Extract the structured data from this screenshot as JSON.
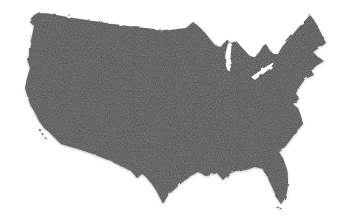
{
  "map": {
    "title": "United States map",
    "region": "Continental United States (lower 48 states)",
    "style": "dark grainy silhouette with dashed state boundaries and Great Lakes cutouts",
    "colors": {
      "background": "#ffffff",
      "land": "#2b2626",
      "state_border": "#0e0b0b",
      "lakes": "#ffffff"
    }
  }
}
